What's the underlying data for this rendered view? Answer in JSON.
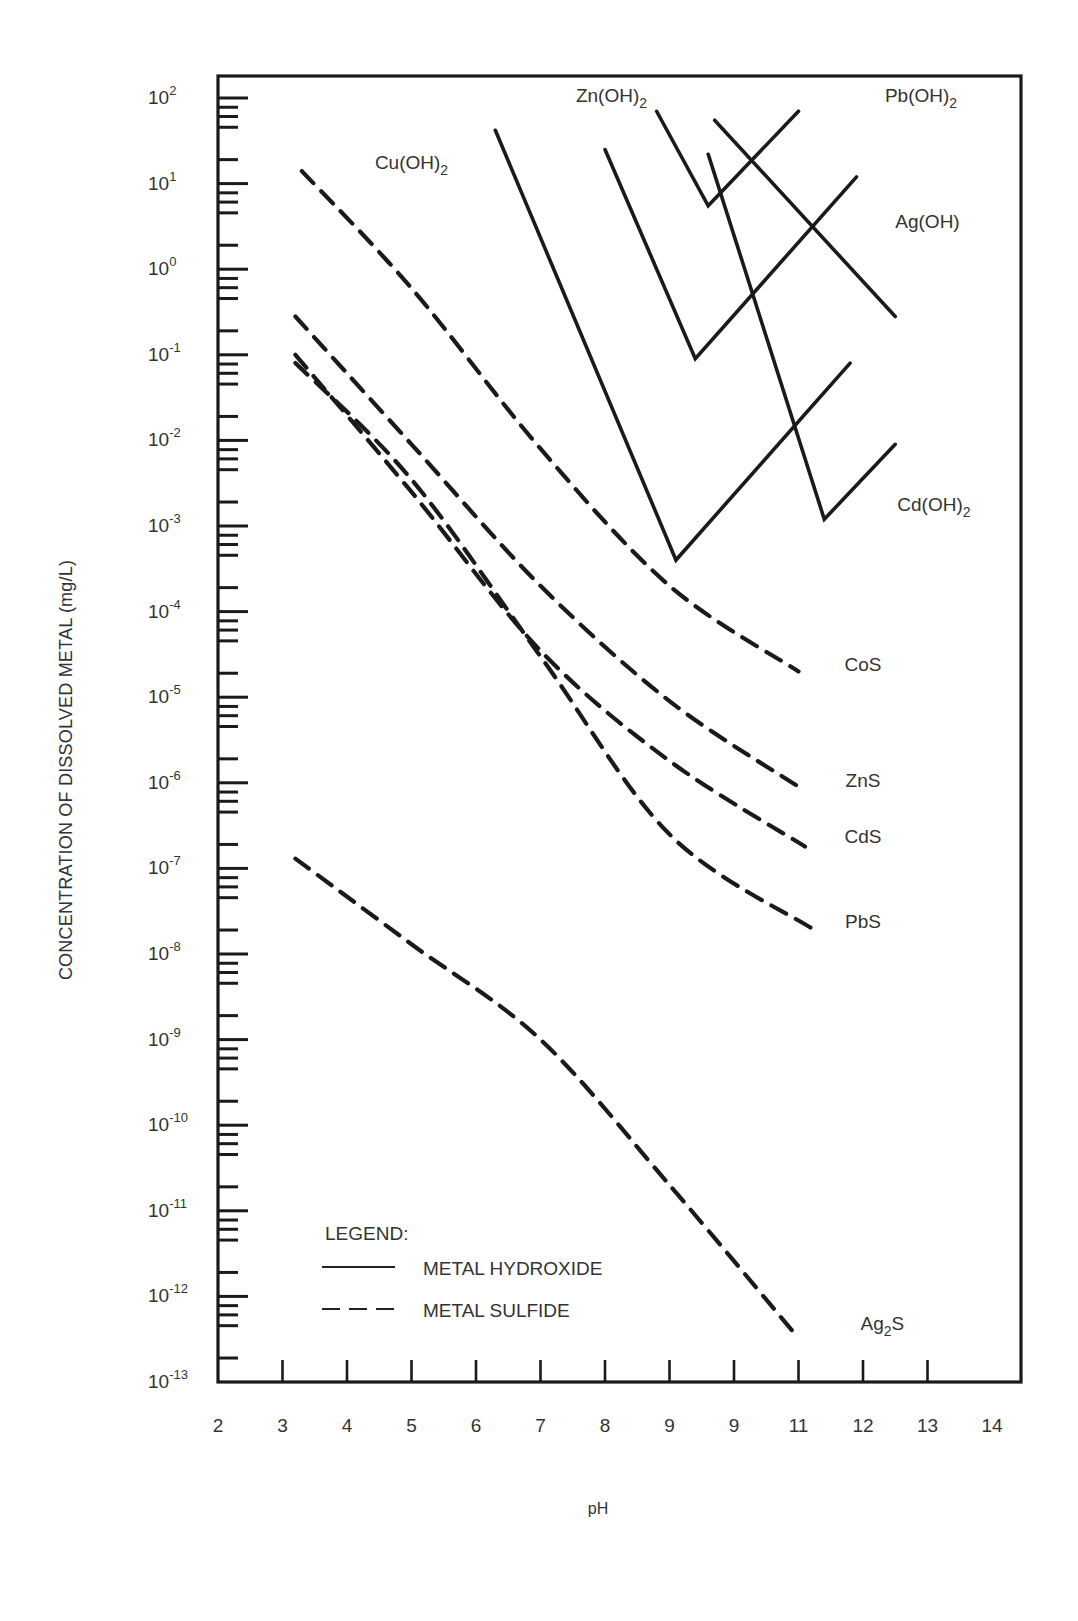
{
  "chart_data": {
    "type": "line",
    "title": "",
    "xlabel": "pH",
    "ylabel": "CONCENTRATION OF DISSOLVED METAL (mg/L)",
    "yscale": "log",
    "xlim": [
      2,
      14
    ],
    "ylim": [
      1e-13,
      100
    ],
    "x_tick_labels": [
      "2",
      "3",
      "4",
      "5",
      "6",
      "7",
      "8",
      "9",
      "9",
      "11",
      "12",
      "13",
      "14"
    ],
    "y_tick_labels": [
      "10^2",
      "10^1",
      "10^0",
      "10^-1",
      "10^-2",
      "10^-3",
      "10^-4",
      "10^-5",
      "10^-6",
      "10^-7",
      "10^-8",
      "10^-9",
      "10^-10",
      "10^-11",
      "10^-12",
      "10^-13"
    ],
    "grid": false,
    "legend": {
      "title": "LEGEND:",
      "entries": [
        {
          "label": "METAL HYDROXIDE",
          "style": "solid"
        },
        {
          "label": "METAL SULFIDE",
          "style": "dashed"
        }
      ],
      "position": "lower-left"
    },
    "series": [
      {
        "name": "Zn(OH)2",
        "style": "solid",
        "points": [
          [
            6.3,
            42
          ],
          [
            9.1,
            0.0004
          ],
          [
            11.8,
            0.08
          ]
        ]
      },
      {
        "name": "Cu(OH)2 (solid V)",
        "style": "solid",
        "points": [
          [
            8.0,
            25
          ],
          [
            9.4,
            0.09
          ],
          [
            11.9,
            12
          ]
        ]
      },
      {
        "name": "Pb(OH)2",
        "style": "solid",
        "points": [
          [
            8.8,
            70
          ],
          [
            9.6,
            5.5
          ],
          [
            11.0,
            70
          ]
        ]
      },
      {
        "name": "Ag(OH)",
        "style": "solid",
        "points": [
          [
            9.7,
            55
          ],
          [
            12.5,
            0.28
          ]
        ]
      },
      {
        "name": "Cd(OH)2",
        "style": "solid",
        "points": [
          [
            9.6,
            22
          ],
          [
            11.4,
            0.0012
          ],
          [
            12.5,
            0.009
          ]
        ]
      },
      {
        "name": "Cu(OH)2 / CoS (dashed)",
        "style": "dashed",
        "points": [
          [
            3.3,
            14
          ],
          [
            5,
            0.6
          ],
          [
            7,
            0.008
          ],
          [
            9,
            0.0002
          ],
          [
            11.0,
            2e-05
          ]
        ]
      },
      {
        "name": "ZnS",
        "style": "dashed",
        "points": [
          [
            3.2,
            0.28
          ],
          [
            5,
            0.009
          ],
          [
            7,
            0.0002
          ],
          [
            9,
            9e-06
          ],
          [
            11.0,
            9e-07
          ]
        ]
      },
      {
        "name": "CdS",
        "style": "dashed",
        "points": [
          [
            3.2,
            0.1
          ],
          [
            5,
            0.0025
          ],
          [
            7,
            3.5e-05
          ],
          [
            9,
            1.8e-06
          ],
          [
            11.1,
            1.8e-07
          ]
        ]
      },
      {
        "name": "PbS",
        "style": "dashed",
        "points": [
          [
            3.2,
            0.08
          ],
          [
            5,
            0.0035
          ],
          [
            7,
            3e-05
          ],
          [
            9,
            2.5e-07
          ],
          [
            11.2,
            2e-08
          ]
        ]
      },
      {
        "name": "Ag2S",
        "style": "dashed",
        "points": [
          [
            3.2,
            1.3e-07
          ],
          [
            5,
            1.3e-08
          ],
          [
            7,
            1e-09
          ],
          [
            9,
            2e-11
          ],
          [
            10.9,
            4e-13
          ]
        ]
      }
    ],
    "annotations": [
      {
        "text": "Zn(OH)2",
        "x": 8.1,
        "y": 90
      },
      {
        "text": "Pb(OH)2",
        "x": 12.9,
        "y": 90
      },
      {
        "text": "Cu(OH)2",
        "x": 5.0,
        "y": 15
      },
      {
        "text": "Ag(OH)",
        "x": 13.0,
        "y": 3
      },
      {
        "text": "Cd(OH)2",
        "x": 13.1,
        "y": 0.0015
      },
      {
        "text": "CoS",
        "x": 12.0,
        "y": 2e-05
      },
      {
        "text": "ZnS",
        "x": 12.0,
        "y": 9e-07
      },
      {
        "text": "CdS",
        "x": 12.0,
        "y": 2e-07
      },
      {
        "text": "PbS",
        "x": 12.0,
        "y": 2e-08
      },
      {
        "text": "Ag2S",
        "x": 12.3,
        "y": 4e-13
      }
    ]
  },
  "labels": {
    "ylabel": "CONCENTRATION OF DISSOLVED METAL (mg/L)",
    "xlabel": "pH",
    "legend_title": "LEGEND:",
    "legend_hydroxide": "METAL HYDROXIDE",
    "legend_sulfide": "METAL SULFIDE"
  }
}
